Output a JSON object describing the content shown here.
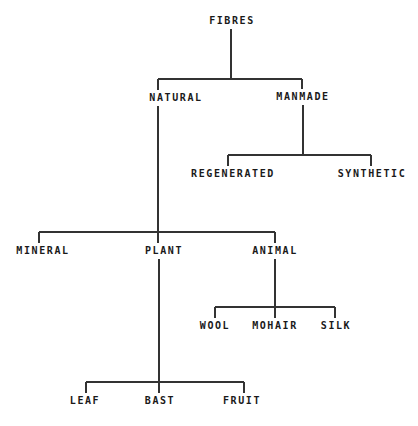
{
  "diagram": {
    "type": "tree",
    "line_color": "#333333",
    "text_color": "#1a1a1a",
    "nodes": {
      "fibres": {
        "label": "FIBRES",
        "x": 232,
        "y": 21
      },
      "natural": {
        "label": "NATURAL",
        "x": 176,
        "y": 98
      },
      "manmade": {
        "label": "MANMADE",
        "x": 303,
        "y": 97
      },
      "regenerated": {
        "label": "REGENERATED",
        "x": 233,
        "y": 174
      },
      "synthetic": {
        "label": "SYNTHETIC",
        "x": 372,
        "y": 174
      },
      "mineral": {
        "label": "MINERAL",
        "x": 43,
        "y": 251
      },
      "plant": {
        "label": "PLANT",
        "x": 164,
        "y": 251
      },
      "animal": {
        "label": "ANIMAL",
        "x": 275,
        "y": 251
      },
      "wool": {
        "label": "WOOL",
        "x": 215,
        "y": 326
      },
      "mohair": {
        "label": "MOHAIR",
        "x": 275,
        "y": 326
      },
      "silk": {
        "label": "SILK",
        "x": 336,
        "y": 326
      },
      "leaf": {
        "label": "LEAF",
        "x": 85,
        "y": 401
      },
      "bast": {
        "label": "BAST",
        "x": 160,
        "y": 401
      },
      "fruit": {
        "label": "FRUIT",
        "x": 242,
        "y": 401
      }
    },
    "edges": [
      [
        "fibres",
        "natural"
      ],
      [
        "fibres",
        "manmade"
      ],
      [
        "manmade",
        "regenerated"
      ],
      [
        "manmade",
        "synthetic"
      ],
      [
        "natural",
        "mineral"
      ],
      [
        "natural",
        "plant"
      ],
      [
        "natural",
        "animal"
      ],
      [
        "animal",
        "wool"
      ],
      [
        "animal",
        "mohair"
      ],
      [
        "animal",
        "silk"
      ],
      [
        "plant",
        "leaf"
      ],
      [
        "plant",
        "bast"
      ],
      [
        "plant",
        "fruit"
      ]
    ]
  }
}
